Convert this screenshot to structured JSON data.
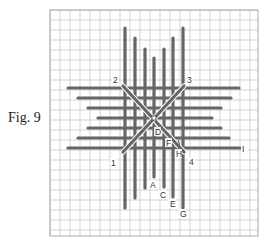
{
  "figure": {
    "label": "Fig. 9",
    "grid": {
      "x0": 50,
      "y0": 10,
      "x1": 258,
      "y1": 236,
      "cell": 10,
      "line_color": "#c8c8c8",
      "border_color": "#aaaaaa"
    },
    "stitch_color": "#666666",
    "center": {
      "x": 154,
      "y": 118
    },
    "vertical_stitches": [
      {
        "x": 125,
        "y1": 28,
        "y2": 208
      },
      {
        "x": 135,
        "y1": 38,
        "y2": 198
      },
      {
        "x": 145,
        "y1": 49,
        "y2": 188
      },
      {
        "x": 154,
        "y1": 58,
        "y2": 177
      },
      {
        "x": 164,
        "y1": 49,
        "y2": 187
      },
      {
        "x": 173,
        "y1": 38,
        "y2": 197
      },
      {
        "x": 183,
        "y1": 28,
        "y2": 208
      }
    ],
    "horizontal_stitches": [
      {
        "y": 88,
        "x1": 68,
        "x2": 239
      },
      {
        "y": 98,
        "x1": 78,
        "x2": 231
      },
      {
        "y": 108,
        "x1": 88,
        "x2": 221
      },
      {
        "y": 118,
        "x1": 98,
        "x2": 212
      },
      {
        "y": 128,
        "x1": 88,
        "x2": 221
      },
      {
        "y": 138,
        "x1": 78,
        "x2": 229
      },
      {
        "y": 148,
        "x1": 68,
        "x2": 240
      }
    ],
    "diagonals": [
      {
        "from": "2",
        "x1": 123,
        "y1": 86,
        "x2": 184,
        "y2": 152
      },
      {
        "from": "3",
        "x1": 184,
        "y1": 86,
        "x2": 123,
        "y2": 152
      }
    ],
    "labels": [
      {
        "text": "2",
        "x": 113,
        "y": 83
      },
      {
        "text": "3",
        "x": 187,
        "y": 83
      },
      {
        "text": "1",
        "x": 111,
        "y": 166
      },
      {
        "text": "4",
        "x": 189,
        "y": 165
      },
      {
        "text": "D",
        "x": 155,
        "y": 135
      },
      {
        "text": "F",
        "x": 166,
        "y": 146
      },
      {
        "text": "H",
        "x": 176,
        "y": 157
      },
      {
        "text": "I",
        "x": 242,
        "y": 152
      },
      {
        "text": "A",
        "x": 150,
        "y": 188
      },
      {
        "text": "C",
        "x": 160,
        "y": 198
      },
      {
        "text": "E",
        "x": 170,
        "y": 207
      },
      {
        "text": "G",
        "x": 180,
        "y": 217
      }
    ]
  }
}
